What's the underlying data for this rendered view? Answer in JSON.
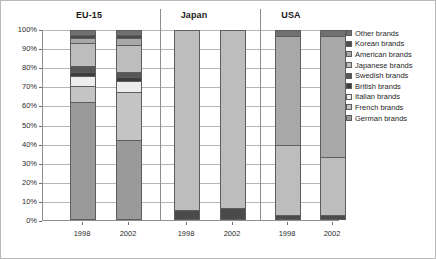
{
  "chart_data": {
    "type": "bar",
    "subtype": "100% stacked column",
    "title": "",
    "xlabel": "",
    "ylabel": "",
    "ylim": [
      0,
      100
    ],
    "ytick_labels": [
      "100%",
      "90%",
      "80%",
      "70%",
      "60%",
      "50%",
      "40%",
      "30%",
      "20%",
      "10%",
      "0%"
    ],
    "ytick_values": [
      100,
      90,
      80,
      70,
      60,
      50,
      40,
      30,
      20,
      10,
      0
    ],
    "grid": true,
    "legend_position": "right",
    "groups": [
      "EU-15",
      "Japan",
      "USA"
    ],
    "categories": [
      "1998",
      "2002",
      "1998",
      "2002",
      "1998",
      "2002"
    ],
    "stack_order_bottom_up": [
      "German brands",
      "French brands",
      "Italian brands",
      "British brands",
      "Swedish brands",
      "Japanese brands",
      "American brands",
      "Korean brands",
      "Other brands"
    ],
    "series": [
      {
        "name": "German brands",
        "color": "#9a9a9a",
        "values": [
          62.0,
          42.0,
          0.0,
          0.0,
          0.0,
          0.0
        ]
      },
      {
        "name": "French brands",
        "color": "#c4c4c4",
        "values": [
          8.5,
          25.0,
          0.0,
          0.0,
          0.0,
          0.0
        ]
      },
      {
        "name": "Italian brands",
        "color": "#ededed",
        "values": [
          5.0,
          6.0,
          0.0,
          0.0,
          0.0,
          0.0
        ]
      },
      {
        "name": "British brands",
        "color": "#3d3d3d",
        "values": [
          2.5,
          2.0,
          0.0,
          0.0,
          0.0,
          0.0
        ]
      },
      {
        "name": "Swedish brands",
        "color": "#565656",
        "values": [
          3.0,
          3.0,
          0.0,
          0.0,
          0.0,
          0.0
        ]
      },
      {
        "name": "Japanese brands",
        "color": "#bdbdbd",
        "values": [
          12.0,
          14.0,
          95.0,
          94.0,
          37.0,
          31.0
        ]
      },
      {
        "name": "American brands",
        "color": "#a8a8a8",
        "values": [
          3.0,
          3.5,
          0.0,
          0.0,
          58.0,
          64.0
        ]
      },
      {
        "name": "Korean brands",
        "color": "#4a4a4a",
        "values": [
          1.5,
          2.0,
          5.0,
          6.0,
          2.0,
          2.0
        ]
      },
      {
        "name": "Other brands",
        "color": "#707070",
        "values": [
          2.5,
          2.5,
          0.0,
          0.0,
          3.0,
          3.0
        ]
      }
    ],
    "legend_entries": [
      {
        "label": "Other brands",
        "color": "#707070"
      },
      {
        "label": "Korean brands",
        "color": "#4a4a4a"
      },
      {
        "label": "American brands",
        "color": "#a8a8a8"
      },
      {
        "label": "Japanese brands",
        "color": "#bdbdbd"
      },
      {
        "label": "Swedish brands",
        "color": "#565656"
      },
      {
        "label": "British brands",
        "color": "#3d3d3d"
      },
      {
        "label": "Italian brands",
        "color": "#ededed"
      },
      {
        "label": "French brands",
        "color": "#c4c4c4"
      },
      {
        "label": "German brands",
        "color": "#9a9a9a"
      }
    ],
    "bars": [
      {
        "group": "EU-15",
        "category": "1998",
        "segments": [
          {
            "name": "German brands",
            "value": 62.0,
            "color": "#9a9a9a"
          },
          {
            "name": "French brands",
            "value": 8.5,
            "color": "#c4c4c4"
          },
          {
            "name": "Italian brands",
            "value": 5.0,
            "color": "#ededed"
          },
          {
            "name": "British brands",
            "value": 2.5,
            "color": "#3d3d3d"
          },
          {
            "name": "Swedish brands",
            "value": 3.0,
            "color": "#565656"
          },
          {
            "name": "Japanese brands",
            "value": 12.0,
            "color": "#bdbdbd"
          },
          {
            "name": "American brands",
            "value": 3.0,
            "color": "#a8a8a8"
          },
          {
            "name": "Korean brands",
            "value": 1.5,
            "color": "#4a4a4a"
          },
          {
            "name": "Other brands",
            "value": 2.5,
            "color": "#707070"
          }
        ]
      },
      {
        "group": "EU-15",
        "category": "2002",
        "segments": [
          {
            "name": "German brands",
            "value": 42.0,
            "color": "#9a9a9a"
          },
          {
            "name": "French brands",
            "value": 25.0,
            "color": "#c4c4c4"
          },
          {
            "name": "Italian brands",
            "value": 6.0,
            "color": "#ededed"
          },
          {
            "name": "British brands",
            "value": 2.0,
            "color": "#3d3d3d"
          },
          {
            "name": "Swedish brands",
            "value": 3.0,
            "color": "#565656"
          },
          {
            "name": "Japanese brands",
            "value": 14.0,
            "color": "#bdbdbd"
          },
          {
            "name": "American brands",
            "value": 3.5,
            "color": "#a8a8a8"
          },
          {
            "name": "Korean brands",
            "value": 2.0,
            "color": "#4a4a4a"
          },
          {
            "name": "Other brands",
            "value": 2.5,
            "color": "#707070"
          }
        ]
      },
      {
        "group": "Japan",
        "category": "1998",
        "segments": [
          {
            "name": "Korean brands",
            "value": 5.0,
            "color": "#4a4a4a"
          },
          {
            "name": "Japanese brands",
            "value": 95.0,
            "color": "#bdbdbd"
          }
        ]
      },
      {
        "group": "Japan",
        "category": "2002",
        "segments": [
          {
            "name": "Korean brands",
            "value": 6.0,
            "color": "#4a4a4a"
          },
          {
            "name": "Japanese brands",
            "value": 94.0,
            "color": "#bdbdbd"
          }
        ]
      },
      {
        "group": "USA",
        "category": "1998",
        "segments": [
          {
            "name": "Korean brands",
            "value": 2.0,
            "color": "#4a4a4a"
          },
          {
            "name": "Japanese brands",
            "value": 37.0,
            "color": "#bdbdbd"
          },
          {
            "name": "American brands",
            "value": 58.0,
            "color": "#a8a8a8"
          },
          {
            "name": "Other brands",
            "value": 3.0,
            "color": "#707070"
          }
        ]
      },
      {
        "group": "USA",
        "category": "2002",
        "segments": [
          {
            "name": "Korean brands",
            "value": 2.0,
            "color": "#4a4a4a"
          },
          {
            "name": "Japanese brands",
            "value": 31.0,
            "color": "#bdbdbd"
          },
          {
            "name": "American brands",
            "value": 64.0,
            "color": "#a8a8a8"
          },
          {
            "name": "Other brands",
            "value": 3.0,
            "color": "#707070"
          }
        ]
      }
    ]
  },
  "layout": {
    "group_title_positions": [
      88,
      193,
      290
    ],
    "bar_left_positions": [
      27,
      73,
      131,
      177,
      232,
      277
    ],
    "separator_positions": [
      117,
      217
    ]
  }
}
